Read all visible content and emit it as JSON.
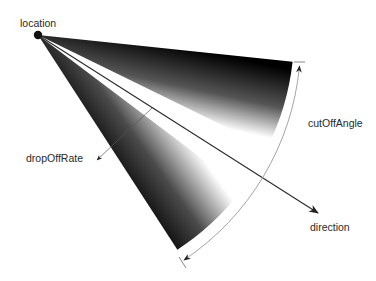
{
  "diagram": {
    "labels": {
      "location": "location",
      "cutOffAngle": "cutOffAngle",
      "dropOffRate": "dropOffRate",
      "direction": "direction"
    },
    "colors": {
      "background": "#ffffff",
      "wedge_dark": "#000000",
      "wedge_light": "#ffffff",
      "arrow": "#2a2a2a",
      "arc": "#9a9a9a",
      "text": "#2a2a2a"
    },
    "nodes": [
      {
        "id": "location",
        "label": "location",
        "shape": "dot",
        "x": 38,
        "y": 35
      },
      {
        "id": "direction",
        "label": "direction",
        "shape": "arrow-tip",
        "x": 318,
        "y": 213
      },
      {
        "id": "cutOffAngle",
        "label": "cutOffAngle",
        "shape": "arc-annotation"
      },
      {
        "id": "dropOffRate",
        "label": "dropOffRate",
        "shape": "arrow-annotation",
        "x": 94,
        "y": 162
      }
    ],
    "edges": [
      {
        "from": "location",
        "to": "direction",
        "style": "solid-arrow"
      },
      {
        "from": "cutOffAngle",
        "to": "cutOffAngle",
        "style": "double-arrow-arc"
      }
    ],
    "wedges": [
      {
        "name": "upper-cone-half",
        "angle_outer_deg": 6,
        "angle_inner_deg": 26
      },
      {
        "name": "lower-cone-half",
        "angle_inner_deg": 37,
        "angle_outer_deg": 57
      }
    ]
  }
}
